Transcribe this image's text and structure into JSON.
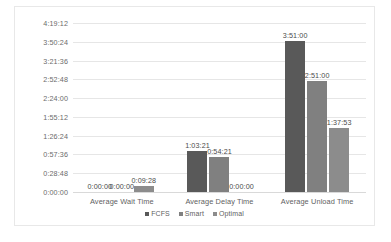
{
  "chart_data": {
    "type": "bar",
    "title": "",
    "xlabel": "",
    "ylabel": "",
    "categories": [
      "Average Wait Time",
      "Average Delay Time",
      "Average Unload Time"
    ],
    "series": [
      {
        "name": "FCFS",
        "color": "#595959",
        "values": [
          "0:00:00",
          "1:03:21",
          "3:51:00"
        ],
        "seconds": [
          0,
          3801,
          13860
        ]
      },
      {
        "name": "Smart",
        "color": "#808080",
        "values": [
          "0:00:00",
          "0:54:21",
          "2:51:00"
        ],
        "seconds": [
          0,
          3261,
          10260
        ]
      },
      {
        "name": "Optimal",
        "color": "#8c8c8c",
        "values": [
          "0:09:28",
          "0:00:00",
          "1:37:53"
        ],
        "seconds": [
          568,
          0,
          5873
        ]
      }
    ],
    "ylim": [
      "0:00:00",
      "4:19:12"
    ],
    "ylim_seconds": [
      0,
      15552
    ],
    "yticks": [
      "0:00:00",
      "0:28:48",
      "0:57:36",
      "1:26:24",
      "1:55:12",
      "2:24:00",
      "2:52:48",
      "3:21:36",
      "3:50:24",
      "4:19:12"
    ],
    "ytick_seconds": [
      0,
      1728,
      3456,
      5184,
      6912,
      8640,
      10368,
      12096,
      13824,
      15552
    ],
    "grid": true,
    "legend_position": "bottom",
    "data_labels": true
  },
  "legend": {
    "items": [
      {
        "label": "FCFS",
        "color": "#595959"
      },
      {
        "label": "Smart",
        "color": "#808080"
      },
      {
        "label": "Optimal",
        "color": "#8c8c8c"
      }
    ]
  },
  "colors": {
    "gridline": "#e6e6e6",
    "border": "#e8e8e8",
    "tick_text": "#6b6b6b",
    "label_text": "#4a4a4a",
    "category_text": "#5f5f5f",
    "background": "#ffffff"
  }
}
